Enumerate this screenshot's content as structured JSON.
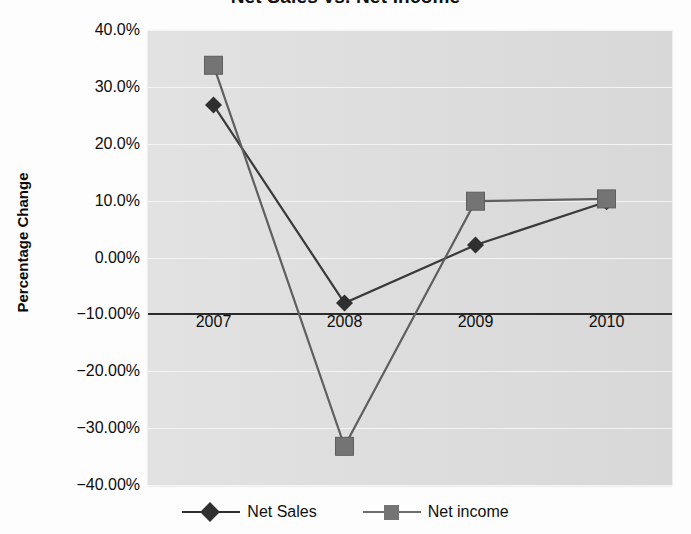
{
  "chart_data": {
    "type": "line",
    "title": "Net Sales vs. Net Income",
    "xlabel": "",
    "ylabel": "Percentage Change",
    "categories": [
      "2007",
      "2008",
      "2009",
      "2010"
    ],
    "series": [
      {
        "name": "Net Sales",
        "marker": "diamond",
        "color": "#2f2f2f",
        "values": [
          26.8,
          -8.0,
          2.2,
          9.8
        ]
      },
      {
        "name": "Net income",
        "marker": "square",
        "color": "#747474",
        "values": [
          33.8,
          -33.2,
          9.9,
          10.3
        ]
      }
    ],
    "ylim": [
      -40,
      40
    ],
    "ytick_values": [
      40,
      30,
      20,
      10,
      0,
      -10,
      -20,
      -30,
      -40
    ],
    "ytick_labels": [
      "40.0%",
      "30.0%",
      "20.0%",
      "10.0%",
      "0.00%",
      "-10.00%",
      "-20.00%",
      "-30.00%",
      "-40.00%"
    ],
    "grid": true,
    "gridline_color": "#f4f4f4",
    "plot_background": "#dcdcdc",
    "axis_line_value": -10,
    "axis_line_color": "#2b2b2b",
    "legend_position": "bottom"
  },
  "legend": {
    "items": [
      {
        "label": "Net Sales",
        "marker": "diamond-marker",
        "color": "#2f2f2f"
      },
      {
        "label": "Net income",
        "marker": "square-marker",
        "color": "#747474"
      }
    ]
  }
}
